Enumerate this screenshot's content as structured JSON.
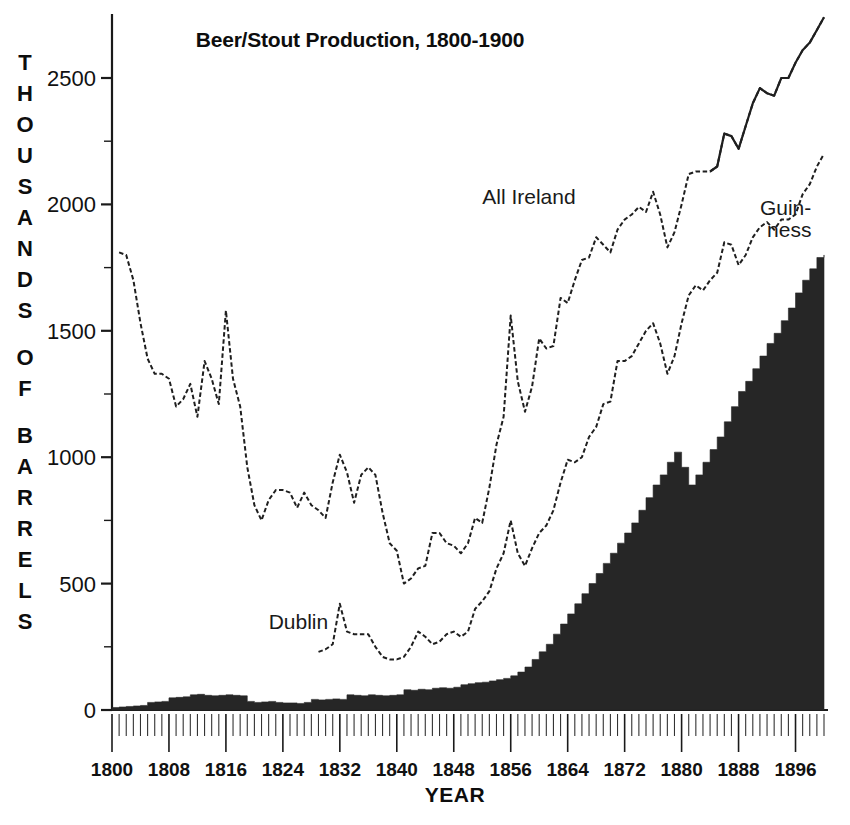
{
  "chart_data": {
    "type": "line",
    "title": "Beer/Stout Production, 1800-1900",
    "xlabel": "YEAR",
    "ylabel": "THOUSANDS OF BARRELS",
    "ylabel_chars": [
      "T",
      "H",
      "O",
      "U",
      "S",
      "A",
      "N",
      "D",
      "S",
      "",
      "O",
      "F",
      "",
      "B",
      "A",
      "R",
      "R",
      "E",
      "L",
      "S"
    ],
    "grid": false,
    "legend_position": "inline-annotations",
    "xlim": [
      1800,
      1900
    ],
    "ylim": [
      0,
      2500
    ],
    "y_ticks": [
      0,
      500,
      1000,
      1500,
      2000,
      2500
    ],
    "y_tick_labels": [
      "0",
      "500",
      "1000",
      "1500",
      "2000",
      "2500"
    ],
    "y_minor_tick_step": 250,
    "x_ticks": [
      1800,
      1808,
      1816,
      1824,
      1832,
      1840,
      1848,
      1856,
      1864,
      1872,
      1880,
      1888,
      1896
    ],
    "x_tick_labels": [
      "1800",
      "1808",
      "1816",
      "1824",
      "1832",
      "1840",
      "1848",
      "1856",
      "1864",
      "1872",
      "1880",
      "1888",
      "1896"
    ],
    "x_minor_tick_step": 1,
    "annotations": [
      {
        "text": "All Ireland",
        "x": 1852,
        "y": 2000,
        "name": "all-ireland-label"
      },
      {
        "text": "Dublin",
        "x": 1822,
        "y": 320,
        "name": "dublin-label"
      },
      {
        "text": "Guin-",
        "x": 1891,
        "y": 1960,
        "name": "guinness-label-line1"
      },
      {
        "text": "ness",
        "x": 1892,
        "y": 1870,
        "name": "guinness-label-line2"
      }
    ],
    "series": [
      {
        "name": "All Ireland",
        "style": "dotted-line",
        "color": "#1f1f1f",
        "x": [
          1801,
          1802,
          1803,
          1804,
          1805,
          1806,
          1807,
          1808,
          1809,
          1810,
          1811,
          1812,
          1813,
          1814,
          1815,
          1816,
          1817,
          1818,
          1819,
          1820,
          1821,
          1822,
          1823,
          1824,
          1825,
          1826,
          1827,
          1828,
          1829,
          1830,
          1831,
          1832,
          1833,
          1834,
          1835,
          1836,
          1837,
          1838,
          1839,
          1840,
          1841,
          1842,
          1843,
          1844,
          1845,
          1846,
          1847,
          1848,
          1849,
          1850,
          1851,
          1852,
          1853,
          1854,
          1855,
          1856,
          1857,
          1858,
          1859,
          1860,
          1861,
          1862,
          1863,
          1864,
          1865,
          1866,
          1867,
          1868,
          1869,
          1870,
          1871,
          1872,
          1873,
          1874,
          1875,
          1876,
          1877,
          1878,
          1879,
          1880,
          1881,
          1882,
          1883,
          1884,
          1885,
          1886,
          1887,
          1888,
          1889,
          1890,
          1891,
          1892,
          1893,
          1894,
          1895,
          1896,
          1897,
          1898,
          1899,
          1900
        ],
        "values": [
          1810,
          1800,
          1700,
          1530,
          1390,
          1330,
          1330,
          1310,
          1200,
          1230,
          1290,
          1160,
          1380,
          1310,
          1210,
          1580,
          1310,
          1200,
          960,
          810,
          750,
          830,
          870,
          870,
          860,
          800,
          860,
          810,
          790,
          760,
          900,
          1010,
          940,
          820,
          930,
          960,
          930,
          780,
          660,
          630,
          500,
          520,
          560,
          570,
          700,
          700,
          660,
          650,
          620,
          660,
          760,
          740,
          880,
          1050,
          1160,
          1560,
          1300,
          1180,
          1280,
          1470,
          1430,
          1440,
          1630,
          1610,
          1700,
          1780,
          1790,
          1870,
          1840,
          1810,
          1900,
          1940,
          1960,
          1990,
          1970,
          2050,
          1960,
          1830,
          1890,
          2000,
          2120,
          2130,
          2130,
          2130,
          2150,
          2280,
          2270,
          2220,
          2310,
          2400,
          2460,
          2440,
          2430,
          2500,
          2500,
          2560,
          2610,
          2640,
          2690,
          2740
        ]
      },
      {
        "name": "Dublin",
        "style": "dotted-line",
        "color": "#1f1f1f",
        "x": [
          1829,
          1830,
          1831,
          1832,
          1833,
          1834,
          1835,
          1836,
          1837,
          1838,
          1839,
          1840,
          1841,
          1842,
          1843,
          1844,
          1845,
          1846,
          1847,
          1848,
          1849,
          1850,
          1851,
          1852,
          1853,
          1854,
          1855,
          1856,
          1857,
          1858,
          1859,
          1860,
          1861,
          1862,
          1863,
          1864,
          1865,
          1866,
          1867,
          1868,
          1869,
          1870,
          1871,
          1872,
          1873,
          1874,
          1875,
          1876,
          1877,
          1878,
          1879,
          1880,
          1881,
          1882,
          1883,
          1884,
          1885,
          1886,
          1887,
          1888,
          1889,
          1890,
          1891,
          1892,
          1893,
          1894,
          1895,
          1896,
          1897,
          1898,
          1899,
          1900
        ],
        "values": [
          230,
          240,
          260,
          420,
          310,
          300,
          300,
          300,
          250,
          210,
          200,
          200,
          210,
          250,
          310,
          290,
          260,
          270,
          300,
          310,
          290,
          310,
          400,
          430,
          470,
          560,
          620,
          750,
          620,
          570,
          640,
          700,
          730,
          790,
          900,
          990,
          980,
          1000,
          1080,
          1120,
          1210,
          1220,
          1380,
          1380,
          1400,
          1450,
          1500,
          1530,
          1450,
          1330,
          1400,
          1530,
          1640,
          1680,
          1660,
          1700,
          1730,
          1850,
          1840,
          1760,
          1800,
          1870,
          1910,
          1930,
          1900,
          1940,
          1940,
          1960,
          2040,
          2080,
          2150,
          2200
        ]
      },
      {
        "name": "Guinness",
        "style": "filled-area",
        "color": "#262626",
        "x": [
          1800,
          1801,
          1802,
          1803,
          1804,
          1805,
          1806,
          1807,
          1808,
          1809,
          1810,
          1811,
          1812,
          1813,
          1814,
          1815,
          1816,
          1817,
          1818,
          1819,
          1820,
          1821,
          1822,
          1823,
          1824,
          1825,
          1826,
          1827,
          1828,
          1829,
          1830,
          1831,
          1832,
          1833,
          1834,
          1835,
          1836,
          1837,
          1838,
          1839,
          1840,
          1841,
          1842,
          1843,
          1844,
          1845,
          1846,
          1847,
          1848,
          1849,
          1850,
          1851,
          1852,
          1853,
          1854,
          1855,
          1856,
          1857,
          1858,
          1859,
          1860,
          1861,
          1862,
          1863,
          1864,
          1865,
          1866,
          1867,
          1868,
          1869,
          1870,
          1871,
          1872,
          1873,
          1874,
          1875,
          1876,
          1877,
          1878,
          1879,
          1880,
          1881,
          1882,
          1883,
          1884,
          1885,
          1886,
          1887,
          1888,
          1889,
          1890,
          1891,
          1892,
          1893,
          1894,
          1895,
          1896,
          1897,
          1898,
          1899,
          1900
        ],
        "values": [
          10,
          12,
          14,
          16,
          18,
          30,
          32,
          34,
          48,
          50,
          52,
          60,
          62,
          58,
          56,
          58,
          60,
          58,
          56,
          34,
          30,
          32,
          34,
          30,
          28,
          28,
          26,
          30,
          42,
          40,
          42,
          44,
          42,
          60,
          58,
          56,
          60,
          58,
          56,
          58,
          60,
          80,
          78,
          82,
          80,
          86,
          88,
          86,
          90,
          100,
          104,
          108,
          110,
          115,
          120,
          125,
          135,
          150,
          170,
          200,
          230,
          260,
          300,
          340,
          380,
          420,
          460,
          500,
          540,
          580,
          620,
          660,
          700,
          740,
          790,
          840,
          890,
          930,
          980,
          1020,
          960,
          890,
          930,
          980,
          1030,
          1080,
          1140,
          1200,
          1260,
          1300,
          1350,
          1400,
          1450,
          1490,
          1540,
          1590,
          1650,
          1700,
          1745,
          1790,
          1800
        ]
      }
    ]
  }
}
